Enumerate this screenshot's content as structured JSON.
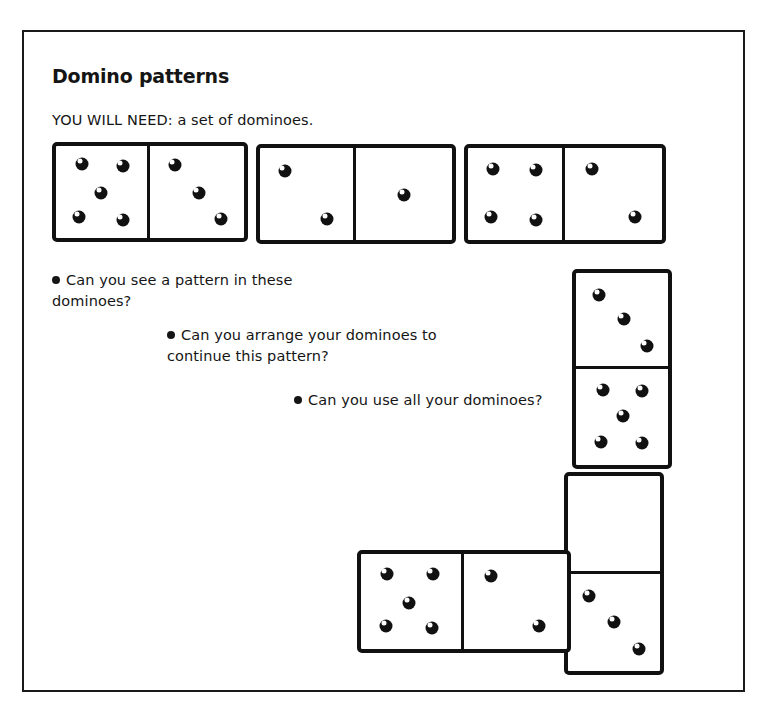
{
  "worksheet": {
    "title": "Domino patterns",
    "materials": "YOU WILL NEED: a set of dominoes.",
    "questions": [
      {
        "line1": "Can you see a pattern in these",
        "line2": "dominoes?"
      },
      {
        "line1": "Can you arrange your dominoes to",
        "line2": "continue this pattern?"
      },
      {
        "line1": "Can you use all your dominoes?",
        "line2": ""
      }
    ]
  },
  "dominoes": [
    {
      "id": "domino-1",
      "orientation": "horizontal",
      "first": 5,
      "second": 3
    },
    {
      "id": "domino-2",
      "orientation": "horizontal",
      "first": 2,
      "second": 1
    },
    {
      "id": "domino-3",
      "orientation": "horizontal",
      "first": 4,
      "second": 2
    },
    {
      "id": "domino-4",
      "orientation": "vertical",
      "first": 3,
      "second": 5
    },
    {
      "id": "domino-5",
      "orientation": "vertical",
      "first": 0,
      "second": 3
    },
    {
      "id": "domino-6",
      "orientation": "horizontal",
      "first": 5,
      "second": 2
    }
  ],
  "colors": {
    "ink": "#111111",
    "paper": "#ffffff",
    "frame": "#1a1a1a"
  }
}
